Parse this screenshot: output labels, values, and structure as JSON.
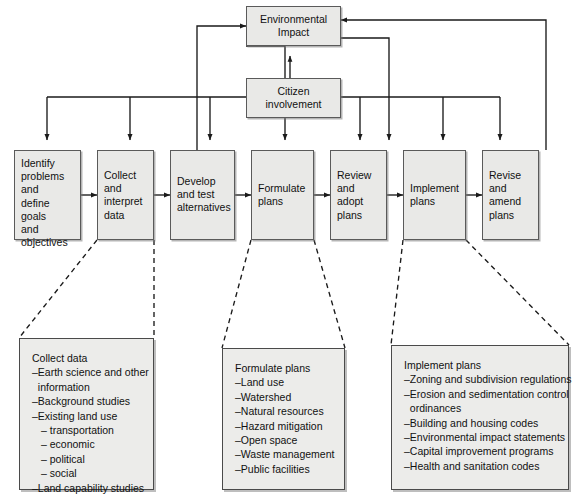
{
  "diagram": {
    "colors": {
      "box_fill": "#e9e9e7",
      "box_border": "#5a5a5a",
      "detail_fill": "#ececea",
      "line": "#1a1a1a",
      "background": "#ffffff"
    },
    "top_boxes": [
      {
        "id": "environmental-impact",
        "label": "Environmental\nImpact"
      },
      {
        "id": "citizen-involvement",
        "label": "Citizen\ninvolvement"
      }
    ],
    "process_boxes": [
      {
        "id": "identify-problems",
        "label": "Identify\nproblems\nand\ndefine goals\nand\nobjectives"
      },
      {
        "id": "collect-interpret-data",
        "label": "Collect\nand\ninterpret\ndata"
      },
      {
        "id": "develop-test-alternatives",
        "label": "Develop\nand test\nalternatives"
      },
      {
        "id": "formulate-plans",
        "label": "Formulate\nplans"
      },
      {
        "id": "review-adopt-plans",
        "label": "Review\nand\nadopt\nplans"
      },
      {
        "id": "implement-plans",
        "label": "Implement\nplans"
      },
      {
        "id": "revise-amend-plans",
        "label": "Revise\nand\namend\nplans"
      }
    ],
    "detail_boxes": [
      {
        "id": "collect-data-detail",
        "title": "Collect data",
        "items": [
          {
            "text": "–Earth science and other",
            "sub": false
          },
          {
            "text": "  information",
            "sub": false
          },
          {
            "text": "–Background studies",
            "sub": false
          },
          {
            "text": "–Existing land use",
            "sub": false
          },
          {
            "text": "– transportation",
            "sub": true
          },
          {
            "text": "– economic",
            "sub": true
          },
          {
            "text": "– political",
            "sub": true
          },
          {
            "text": "– social",
            "sub": true
          },
          {
            "text": "–Land capability studies",
            "sub": false
          }
        ]
      },
      {
        "id": "formulate-plans-detail",
        "title": "Formulate plans",
        "items": [
          {
            "text": "–Land use",
            "sub": false
          },
          {
            "text": "–Watershed",
            "sub": false
          },
          {
            "text": "–Natural resources",
            "sub": false
          },
          {
            "text": "–Hazard mitigation",
            "sub": false
          },
          {
            "text": "–Open space",
            "sub": false
          },
          {
            "text": "–Waste management",
            "sub": false
          },
          {
            "text": "–Public facilities",
            "sub": false
          }
        ]
      },
      {
        "id": "implement-plans-detail",
        "title": "Implement plans",
        "items": [
          {
            "text": "–Zoning and subdivision regulations",
            "sub": false
          },
          {
            "text": "–Erosion and sedimentation control",
            "sub": false
          },
          {
            "text": "  ordinances",
            "sub": false
          },
          {
            "text": "–Building and housing codes",
            "sub": false
          },
          {
            "text": "–Environmental impact statements",
            "sub": false
          },
          {
            "text": "–Capital improvement programs",
            "sub": false
          },
          {
            "text": "–Health and sanitation codes",
            "sub": false
          }
        ]
      }
    ]
  }
}
